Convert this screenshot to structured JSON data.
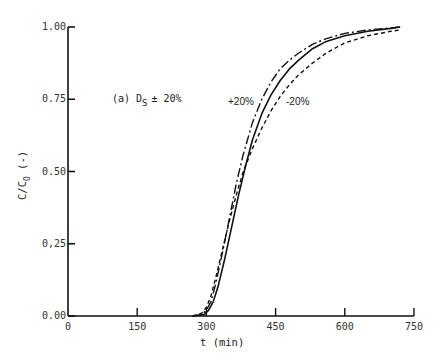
{
  "chart_data": {
    "type": "line",
    "title": "",
    "annotation": "(a) D",
    "annotation_sub": "S",
    "annotation_suffix": "± 20%",
    "xlabel": "t (min)",
    "ylabel": "C/C",
    "ylabel_sub": "O",
    "ylabel_suffix": "(-)",
    "xlim": [
      0,
      750
    ],
    "ylim": [
      0,
      1
    ],
    "xticks": [
      0,
      150,
      300,
      450,
      600,
      750
    ],
    "xtick_labels": [
      "0",
      "150",
      "300",
      "450",
      "600",
      "750"
    ],
    "yticks": [
      0,
      0.25,
      0.5,
      0.75,
      1.0
    ],
    "ytick_labels": [
      "0.00",
      "0,25",
      "0.50",
      "0.75",
      "1.00"
    ],
    "grid": false,
    "series": [
      {
        "name": "+20%",
        "style": "dash-dot",
        "x": [
          270,
          290,
          300,
          310,
          320,
          335,
          350,
          365,
          380,
          400,
          420,
          440,
          460,
          480,
          500,
          530,
          560,
          600,
          650,
          700,
          720
        ],
        "y": [
          0.0,
          0.005,
          0.02,
          0.05,
          0.11,
          0.22,
          0.34,
          0.46,
          0.56,
          0.67,
          0.75,
          0.81,
          0.855,
          0.885,
          0.91,
          0.94,
          0.96,
          0.978,
          0.99,
          0.997,
          1.0
        ]
      },
      {
        "name": "base",
        "style": "solid",
        "x": [
          270,
          295,
          305,
          315,
          325,
          340,
          355,
          370,
          385,
          400,
          420,
          440,
          460,
          480,
          500,
          530,
          560,
          600,
          650,
          700,
          720
        ],
        "y": [
          0.0,
          0.005,
          0.02,
          0.05,
          0.1,
          0.2,
          0.31,
          0.42,
          0.52,
          0.61,
          0.7,
          0.765,
          0.815,
          0.855,
          0.885,
          0.925,
          0.95,
          0.97,
          0.985,
          0.995,
          1.0
        ]
      },
      {
        "name": "-20%",
        "style": "dashed",
        "x": [
          270,
          290,
          300,
          310,
          320,
          335,
          350,
          365,
          380,
          400,
          420,
          440,
          460,
          480,
          500,
          530,
          560,
          600,
          650,
          700,
          720
        ],
        "y": [
          0.0,
          0.01,
          0.03,
          0.07,
          0.13,
          0.23,
          0.33,
          0.42,
          0.5,
          0.58,
          0.65,
          0.71,
          0.76,
          0.8,
          0.835,
          0.875,
          0.91,
          0.945,
          0.97,
          0.985,
          0.99
        ]
      }
    ],
    "curve_labels": [
      {
        "text": "+20%",
        "x": 455,
        "y": 0.68
      },
      {
        "text": "-20%",
        "x": 520,
        "y": 0.68
      }
    ]
  }
}
